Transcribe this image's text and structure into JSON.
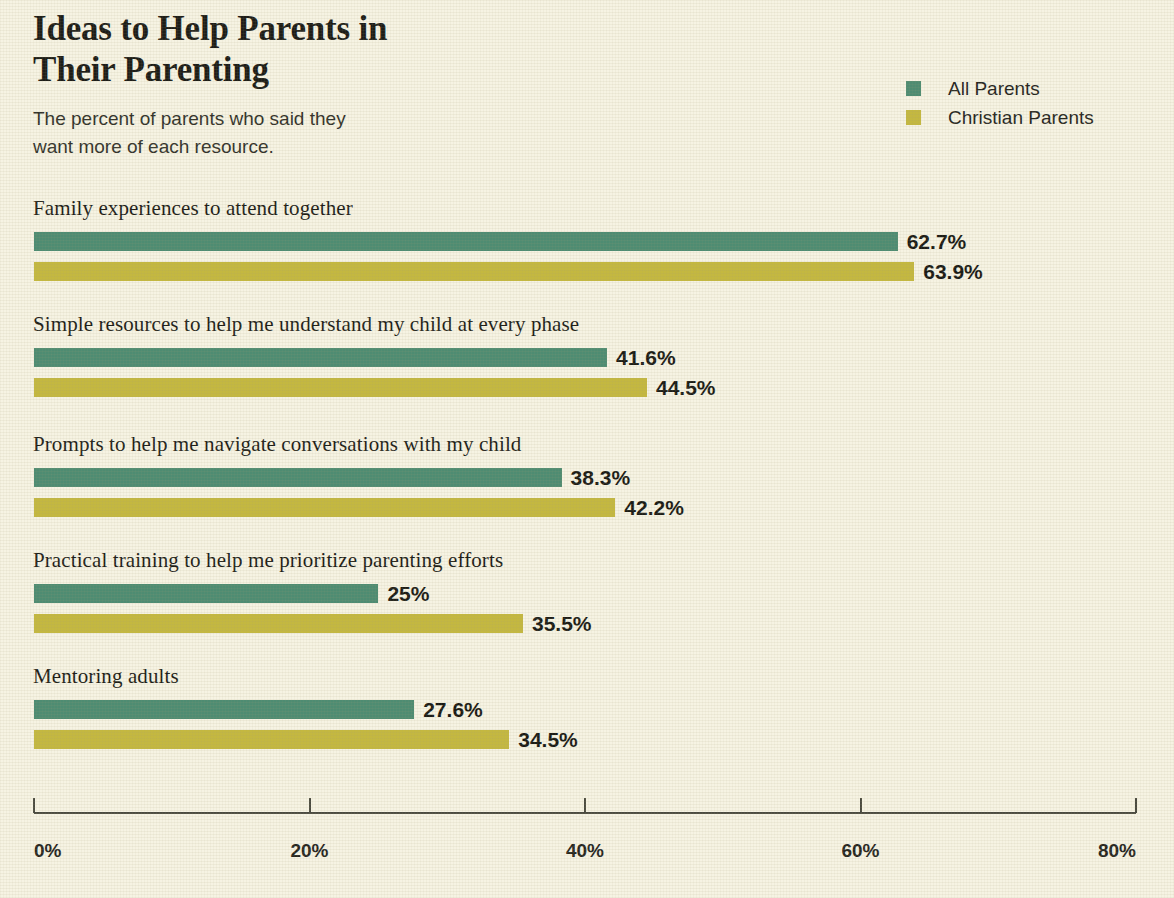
{
  "header": {
    "title": "Ideas to Help Parents in\nTheir Parenting",
    "subtitle": "The percent of parents who said they\nwant more of each resource."
  },
  "legend": {
    "items": [
      {
        "label": "All Parents",
        "color": "#4e8c72"
      },
      {
        "label": "Christian Parents",
        "color": "#c4b840"
      }
    ]
  },
  "axis": {
    "ticks": [
      "0%",
      "20%",
      "40%",
      "60%",
      "80%"
    ],
    "tick_values": [
      0,
      20,
      40,
      60,
      80
    ]
  },
  "chart_data": {
    "type": "bar",
    "orientation": "horizontal",
    "title": "Ideas to Help Parents in Their Parenting",
    "subtitle": "The percent of parents who said they want more of each resource.",
    "xlabel": "",
    "ylabel": "",
    "xlim": [
      0,
      80
    ],
    "xticks": [
      0,
      20,
      40,
      60,
      80
    ],
    "xtick_labels": [
      "0%",
      "20%",
      "40%",
      "60%",
      "80%"
    ],
    "grid": false,
    "legend_position": "top-right",
    "categories": [
      "Family experiences to attend together",
      "Simple resources to help me understand my child at every phase",
      "Prompts to help me navigate conversations with my child",
      "Practical training to help me prioritize parenting efforts",
      "Mentoring adults"
    ],
    "series": [
      {
        "name": "All Parents",
        "color": "#4e8c72",
        "values": [
          62.7,
          41.6,
          38.3,
          25,
          27.6
        ],
        "labels": [
          "62.7%",
          "41.6%",
          "38.3%",
          "25%",
          "27.6%"
        ]
      },
      {
        "name": "Christian Parents",
        "color": "#c4b840",
        "values": [
          63.9,
          44.5,
          42.2,
          35.5,
          34.5
        ],
        "labels": [
          "63.9%",
          "44.5%",
          "42.2%",
          "35.5%",
          "34.5%"
        ]
      }
    ]
  }
}
